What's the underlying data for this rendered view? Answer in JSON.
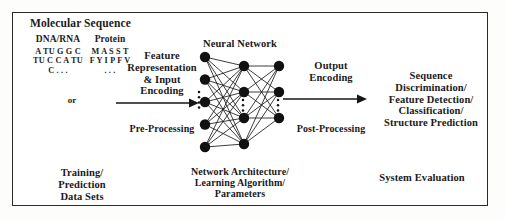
{
  "diagram": {
    "title": "Molecular Sequence",
    "input": {
      "dna_header": "DNA/RNA",
      "protein_header": "Protein",
      "or_label": "or",
      "dna_sequence": "A\nTU\nG\nG\nC\nTU\nC\nC\nA\nTU\nC\n.\n.\n.",
      "protein_sequence": "M\nA\nS\nS\nT\nF\nY\nI\nP\nF\nV\n.\n.\n.",
      "caption": "Training/\nPrediction\nData Sets"
    },
    "preprocessing": {
      "title": "Feature\nRepresentation\n& Input\nEncoding",
      "subtitle": "Pre-Processing"
    },
    "network": {
      "title": "Neural Network",
      "caption": "Network Architecture/\nLearning Algorithm/\nParameters",
      "layers": [
        {
          "name": "input-layer",
          "nodes": 5
        },
        {
          "name": "hidden-layer",
          "nodes": 4
        },
        {
          "name": "output-layer",
          "nodes": 3
        }
      ]
    },
    "postprocessing": {
      "title": "Output\nEncoding",
      "subtitle": "Post-Processing"
    },
    "output": {
      "title": "Sequence\nDiscrimination/\nFeature Detection/\nClassification/\nStructure Prediction",
      "caption": "System Evaluation"
    },
    "colors": {
      "ink": "#1a1a1a",
      "border": "#2b2b2b",
      "node": "#111111",
      "background": "#ffffff"
    }
  }
}
